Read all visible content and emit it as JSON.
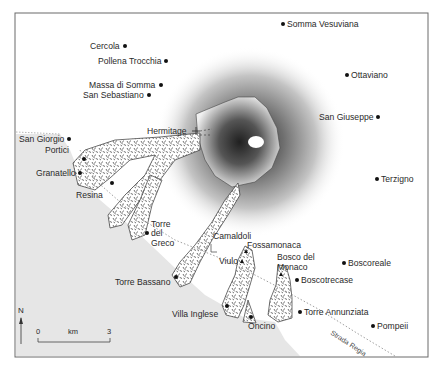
{
  "map": {
    "title": "Vesuvius and surrounding towns with lava flows",
    "colors": {
      "sea": "#e6e6e6",
      "land": "#ffffff",
      "frame": "#6a6a6a",
      "crater_dark": "#3a3a3a",
      "lava_fill": "#ffffff",
      "lava_hatch": "#333333",
      "road": "#888888"
    },
    "towns": [
      {
        "name": "Somma Vesuviana",
        "x": 283,
        "y": 24,
        "label_side": "right"
      },
      {
        "name": "Cercola",
        "x": 125,
        "y": 46,
        "label_side": "left"
      },
      {
        "name": "Pollena Trocchia",
        "x": 166,
        "y": 61,
        "label_side": "left"
      },
      {
        "name": "Ottaviano",
        "x": 347,
        "y": 75,
        "label_side": "right"
      },
      {
        "name": "Massa di Somma",
        "x": 161,
        "y": 85,
        "label_side": "left"
      },
      {
        "name": "San Sebastiano",
        "x": 149,
        "y": 95,
        "label_side": "left"
      },
      {
        "name": "San Giuseppe",
        "x": 378,
        "y": 117,
        "label_side": "left"
      },
      {
        "name": "San Giorgio",
        "x": 69,
        "y": 139,
        "label_side": "left"
      },
      {
        "name": "Portici",
        "x": 84,
        "y": 158,
        "label_side": "left"
      },
      {
        "name": "Granatello",
        "x": 80,
        "y": 173,
        "label_side": "left"
      },
      {
        "name": "Terzigno",
        "x": 377,
        "y": 179,
        "label_side": "right"
      },
      {
        "name": "Resina",
        "x": 112,
        "y": 183,
        "label_side": "below-left"
      },
      {
        "name": "Torre del Greco",
        "x": 147,
        "y": 233,
        "label_side": "right-multi",
        "lines": [
          "Torre",
          "del",
          "Greco"
        ]
      },
      {
        "name": "Torre Bassano",
        "x": 176,
        "y": 277,
        "label_side": "left"
      },
      {
        "name": "Boscoreale",
        "x": 344,
        "y": 263,
        "label_side": "right"
      },
      {
        "name": "Boscotrecase",
        "x": 297,
        "y": 280,
        "label_side": "right"
      },
      {
        "name": "Torre Annunziata",
        "x": 300,
        "y": 312,
        "label_side": "right"
      },
      {
        "name": "Villa Inglese",
        "x": 227,
        "y": 306,
        "label_side": "left"
      },
      {
        "name": "Oncino",
        "x": 251,
        "y": 317,
        "label_side": "below"
      },
      {
        "name": "Pompeii",
        "x": 373,
        "y": 326,
        "label_side": "right"
      }
    ],
    "sites": [
      {
        "name": "Hermitage",
        "type": "cross",
        "x": 196,
        "y": 131
      },
      {
        "name": "Camaldoli",
        "type": "square-outline",
        "x": 213,
        "y": 248
      },
      {
        "name": "Fossamonaca",
        "type": "triangle",
        "x": 246,
        "y": 251
      },
      {
        "name": "Viulo",
        "type": "triangle",
        "x": 242,
        "y": 261
      },
      {
        "name": "Bosco del Monaco",
        "type": "triangle",
        "lines": [
          "Bosco del",
          "Monaco"
        ],
        "x": 281,
        "y": 274
      }
    ],
    "road": {
      "name": "Strada Regia"
    },
    "north_arrow": {
      "label": "N"
    },
    "scale_bar": {
      "start": "0",
      "unit": "km",
      "end": "3"
    }
  }
}
